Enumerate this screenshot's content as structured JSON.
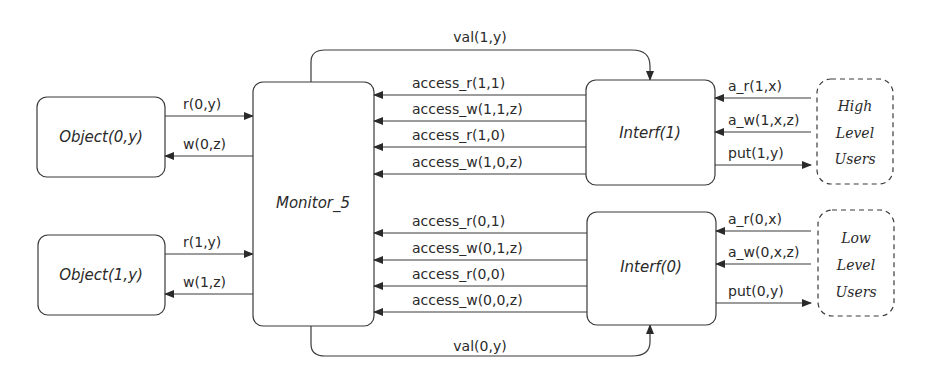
{
  "nodes": {
    "object0": "Object(0,y)",
    "object1": "Object(1,y)",
    "monitor": "Monitor_5",
    "interf1": "Interf(1)",
    "interf0": "Interf(0)",
    "high_users": [
      "High",
      "Level",
      "Users"
    ],
    "low_users": [
      "Low",
      "Level",
      "Users"
    ]
  },
  "edges": {
    "r0": "r(0,y)",
    "w0": "w(0,z)",
    "r1": "r(1,y)",
    "w1": "w(1,z)",
    "val1": "val(1,y)",
    "val0": "val(0,y)",
    "access_high": [
      "access_r(1,1)",
      "access_w(1,1,z)",
      "access_r(1,0)",
      "access_w(1,0,z)"
    ],
    "access_low": [
      "access_r(0,1)",
      "access_w(0,1,z)",
      "access_r(0,0)",
      "access_w(0,0,z)"
    ],
    "high_user_ops": [
      "a_r(1,x)",
      "a_w(1,x,z)",
      "put(1,y)"
    ],
    "low_user_ops": [
      "a_r(0,x)",
      "a_w(0,x,z)",
      "put(0,y)"
    ]
  }
}
